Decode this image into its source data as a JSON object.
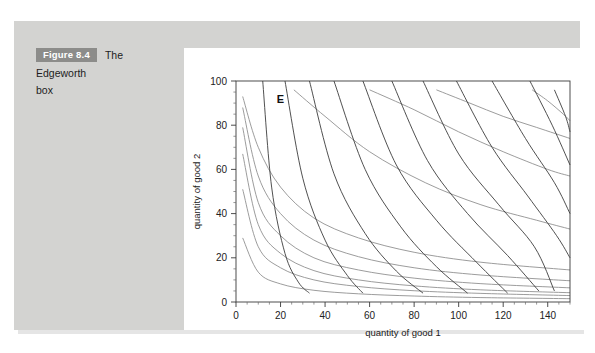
{
  "caption": {
    "badge": "Figure 8.4",
    "title": "The Edgeworth",
    "title_line2": "box"
  },
  "colors": {
    "panel_background": "#d3d3d1",
    "chart_background": "#ffffff",
    "badge_background": "#8c8c8a",
    "badge_text": "#ffffff",
    "curve_a": "#8a8a8a",
    "curve_b": "#3c3c3c",
    "axis": "#3a3a3a"
  },
  "chart_data": {
    "type": "line",
    "title": "",
    "xlabel": "quantity of good 1",
    "ylabel": "quantity of good 2",
    "xlim": [
      0,
      150
    ],
    "ylim": [
      0,
      100
    ],
    "xticks": [
      0,
      20,
      40,
      60,
      80,
      100,
      120,
      140
    ],
    "yticks": [
      0,
      20,
      40,
      60,
      80,
      100
    ],
    "xtick_labels": [
      "0",
      "20",
      "40",
      "60",
      "80",
      "100",
      "120",
      "140"
    ],
    "ytick_labels": [
      "0",
      "20",
      "40",
      "60",
      "80",
      "100"
    ],
    "grid": false,
    "legend": "none",
    "annotations": [
      {
        "label": "E",
        "x": 20,
        "y": 92,
        "name": "endowment-point"
      }
    ],
    "series": [
      {
        "name": "consumer-A-indifference-curve-1",
        "family": "A",
        "color": "#8a8a8a",
        "utility_constant": 150,
        "exponent": 0.62,
        "x": [
          3,
          10,
          20,
          35,
          55,
          80,
          110,
          150
        ],
        "y": [
          29,
          13.5,
          8.2,
          5.3,
          3.7,
          2.7,
          2.0,
          1.5
        ]
      },
      {
        "name": "consumer-A-indifference-curve-2",
        "family": "A",
        "color": "#8a8a8a",
        "utility_constant": 290,
        "exponent": 0.62,
        "x": [
          3,
          10,
          20,
          35,
          55,
          80,
          110,
          150
        ],
        "y": [
          51,
          25,
          15.5,
          10.0,
          7.0,
          5.1,
          3.9,
          2.9
        ]
      },
      {
        "name": "consumer-A-indifference-curve-3",
        "family": "A",
        "color": "#8a8a8a",
        "utility_constant": 420,
        "exponent": 0.62,
        "x": [
          3,
          10,
          20,
          35,
          55,
          80,
          110,
          150
        ],
        "y": [
          67,
          35,
          22,
          14.2,
          10.0,
          7.3,
          5.5,
          4.2
        ]
      },
      {
        "name": "consumer-A-indifference-curve-4",
        "family": "A",
        "color": "#8a8a8a",
        "utility_constant": 580,
        "exponent": 0.58,
        "x": [
          3,
          10,
          20,
          35,
          55,
          80,
          110,
          150
        ],
        "y": [
          79,
          45,
          30,
          20,
          14.5,
          10.8,
          8.3,
          6.4
        ]
      },
      {
        "name": "consumer-A-indifference-curve-5",
        "family": "A",
        "color": "#8a8a8a",
        "utility_constant": 760,
        "exponent": 0.55,
        "x": [
          3,
          10,
          20,
          35,
          55,
          80,
          110,
          150
        ],
        "y": [
          88,
          57,
          40,
          28,
          20.5,
          15.5,
          12.2,
          9.6
        ]
      },
      {
        "name": "consumer-A-indifference-curve-6",
        "family": "A",
        "color": "#8a8a8a",
        "utility_constant": 980,
        "exponent": 0.52,
        "x": [
          3,
          10,
          20,
          35,
          55,
          80,
          110,
          150
        ],
        "y": [
          93,
          70,
          52,
          38,
          29,
          22.5,
          18,
          14.5
        ]
      },
      {
        "name": "consumer-A-indifference-curve-7",
        "family": "A",
        "color": "#8a8a8a",
        "utility_constant": 1250,
        "exponent": 0.5,
        "x": [
          26,
          40,
          60,
          85,
          110,
          135,
          150
        ],
        "y": [
          96,
          84,
          68,
          54,
          44,
          37,
          33
        ]
      },
      {
        "name": "consumer-A-indifference-curve-8",
        "family": "A",
        "color": "#8a8a8a",
        "utility_constant": 1600,
        "exponent": 0.48,
        "x": [
          60,
          80,
          100,
          120,
          140,
          150
        ],
        "y": [
          96,
          87,
          77,
          68,
          60,
          57
        ]
      },
      {
        "name": "consumer-A-indifference-curve-9",
        "family": "A",
        "color": "#8a8a8a",
        "utility_constant": 2000,
        "exponent": 0.46,
        "x": [
          90,
          105,
          120,
          135,
          150
        ],
        "y": [
          96,
          90,
          84,
          79,
          74
        ]
      },
      {
        "name": "consumer-A-indifference-curve-10",
        "family": "A",
        "color": "#8a8a8a",
        "utility_constant": 2400,
        "exponent": 0.45,
        "x": [
          133,
          140,
          147,
          150
        ],
        "y": [
          96,
          91,
          85,
          82
        ]
      },
      {
        "name": "consumer-B-indifference-curve-1",
        "family": "B",
        "color": "#3c3c3c",
        "utility_constant": 160,
        "exponent": 0.6,
        "x": [
          12,
          16,
          22,
          28,
          33
        ],
        "y": [
          100,
          52,
          22,
          9,
          4
        ]
      },
      {
        "name": "consumer-B-indifference-curve-2",
        "family": "B",
        "color": "#3c3c3c",
        "utility_constant": 320,
        "exponent": 0.6,
        "x": [
          22,
          30,
          40,
          50,
          57
        ],
        "y": [
          100,
          56,
          28,
          12,
          4
        ]
      },
      {
        "name": "consumer-B-indifference-curve-3",
        "family": "B",
        "color": "#3c3c3c",
        "utility_constant": 520,
        "exponent": 0.6,
        "x": [
          33,
          44,
          58,
          72,
          84
        ],
        "y": [
          100,
          58,
          31,
          14,
          4
        ]
      },
      {
        "name": "consumer-B-indifference-curve-4",
        "family": "B",
        "color": "#3c3c3c",
        "utility_constant": 760,
        "exponent": 0.6,
        "x": [
          44,
          58,
          74,
          90,
          104
        ],
        "y": [
          100,
          60,
          34,
          16,
          4
        ]
      },
      {
        "name": "consumer-B-indifference-curve-5",
        "family": "B",
        "color": "#3c3c3c",
        "utility_constant": 1050,
        "exponent": 0.6,
        "x": [
          57,
          72,
          90,
          108,
          122
        ],
        "y": [
          100,
          62,
          37,
          18,
          4
        ]
      },
      {
        "name": "consumer-B-indifference-curve-6",
        "family": "B",
        "color": "#3c3c3c",
        "utility_constant": 1380,
        "exponent": 0.6,
        "x": [
          70,
          86,
          104,
          122,
          136
        ],
        "y": [
          100,
          64,
          40,
          21,
          5
        ]
      },
      {
        "name": "consumer-B-indifference-curve-7",
        "family": "B",
        "color": "#3c3c3c",
        "utility_constant": 1750,
        "exponent": 0.6,
        "x": [
          84,
          100,
          118,
          134,
          143
        ],
        "y": [
          100,
          67,
          44,
          25,
          5
        ]
      },
      {
        "name": "consumer-B-indifference-curve-8",
        "family": "B",
        "color": "#3c3c3c",
        "utility_constant": 2150,
        "exponent": 0.6,
        "x": [
          99,
          115,
          131,
          144,
          150
        ],
        "y": [
          100,
          70,
          48,
          30,
          20
        ]
      },
      {
        "name": "consumer-B-indifference-curve-9",
        "family": "B",
        "color": "#3c3c3c",
        "utility_constant": 2600,
        "exponent": 0.6,
        "x": [
          115,
          130,
          143,
          150
        ],
        "y": [
          100,
          74,
          54,
          40
        ]
      },
      {
        "name": "consumer-B-indifference-curve-10",
        "family": "B",
        "color": "#3c3c3c",
        "utility_constant": 3100,
        "exponent": 0.6,
        "x": [
          132,
          142,
          150
        ],
        "y": [
          100,
          80,
          62
        ]
      },
      {
        "name": "consumer-B-indifference-curve-11",
        "family": "B",
        "color": "#3c3c3c",
        "utility_constant": 3600,
        "exponent": 0.6,
        "x": [
          143,
          148,
          150
        ],
        "y": [
          96,
          84,
          77
        ]
      }
    ]
  }
}
